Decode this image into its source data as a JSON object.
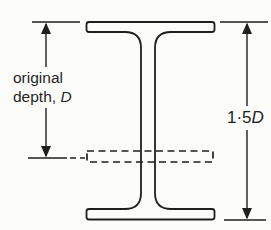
{
  "figure": {
    "background": "#fcfcfa",
    "ink": "#1f1f1f"
  },
  "labels": {
    "original_depth": {
      "line1": "original",
      "line2_text": "depth, ",
      "line2_var": "D"
    },
    "new_depth": {
      "value": "1·5",
      "var": "D"
    }
  }
}
